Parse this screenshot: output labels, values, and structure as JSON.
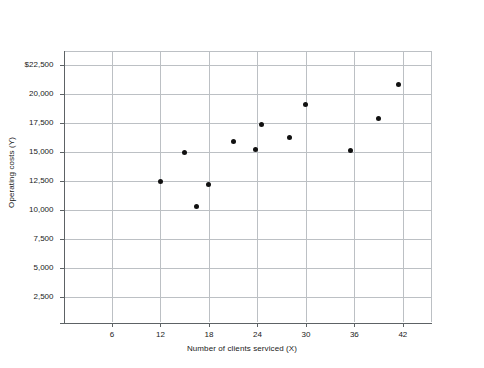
{
  "chart_data": {
    "type": "scatter",
    "title": "",
    "xlabel": "Number of clients serviced (X)",
    "ylabel": "Operating costs (Y)",
    "xlim": [
      0,
      45.5
    ],
    "ylim": [
      0,
      23700
    ],
    "grid": true,
    "legend": "none",
    "x_ticks": [
      6,
      12,
      18,
      24,
      30,
      36,
      42
    ],
    "x_tick_labels": [
      "6",
      "12",
      "18",
      "24",
      "30",
      "36",
      "42"
    ],
    "y_ticks": [
      2500,
      5000,
      7500,
      10000,
      12500,
      15000,
      17500,
      20000,
      22500
    ],
    "y_tick_labels": [
      "2,500",
      "5,000",
      "7,500",
      "10,000",
      "12,500",
      "15,000",
      "17,500",
      "20,000",
      "$22,500"
    ],
    "points": [
      {
        "x": 12,
        "y": 12500
      },
      {
        "x": 15,
        "y": 15000
      },
      {
        "x": 16.5,
        "y": 10300
      },
      {
        "x": 18,
        "y": 12200
      },
      {
        "x": 21,
        "y": 15900
      },
      {
        "x": 23.8,
        "y": 15200
      },
      {
        "x": 24.5,
        "y": 17400
      },
      {
        "x": 28,
        "y": 16300
      },
      {
        "x": 30,
        "y": 19100
      },
      {
        "x": 35.5,
        "y": 15150
      },
      {
        "x": 39,
        "y": 17900
      },
      {
        "x": 41.5,
        "y": 20800
      }
    ],
    "marker_color": "#111111",
    "grid_color": "#bcc0c4",
    "axis_color": "#5d6265",
    "background": "#ffffff"
  }
}
